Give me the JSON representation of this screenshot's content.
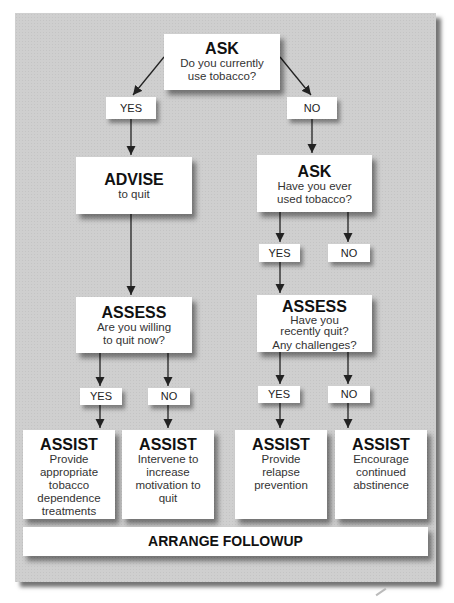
{
  "header_fragment": "Discuss",
  "nodes": {
    "ask1": {
      "title": "ASK",
      "text": "Do you currently use tobacco?"
    },
    "advise": {
      "title": "ADVISE",
      "text": "to quit"
    },
    "ask2": {
      "title": "ASK",
      "text": "Have you ever used tobacco?"
    },
    "assess1": {
      "title": "ASSESS",
      "text": "Are you willing to quit now?"
    },
    "assess2": {
      "title": "ASSESS",
      "line1": "Have you recently quit?",
      "line2": "Any challenges?"
    },
    "assist1": {
      "title": "ASSIST",
      "text": "Provide appropriate tobacco dependence treatments"
    },
    "assist2": {
      "title": "ASSIST",
      "text": "Intervene to increase motivation to quit"
    },
    "assist3": {
      "title": "ASSIST",
      "text": "Provide relapse prevention"
    },
    "assist4": {
      "title": "ASSIST",
      "text": "Encourage continued abstinence"
    },
    "arrange": {
      "title": "ARRANGE FOLLOWUP"
    }
  },
  "labels": {
    "yes": "YES",
    "no": "NO"
  },
  "colors": {
    "panel": "#cfcfcf",
    "box": "#ffffff",
    "arrow": "#222222"
  }
}
